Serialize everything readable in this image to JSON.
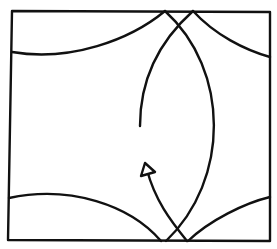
{
  "diagram": {
    "type": "fold-diagram",
    "stroke_color": "#111111",
    "background_color": "#ffffff",
    "elements": [
      {
        "name": "outer-square"
      },
      {
        "name": "top-left-curve"
      },
      {
        "name": "top-right-curve"
      },
      {
        "name": "bottom-left-curve"
      },
      {
        "name": "bottom-right-curve"
      },
      {
        "name": "lens-right-arc"
      },
      {
        "name": "lens-left-arc"
      },
      {
        "name": "fold-arrow"
      }
    ]
  }
}
